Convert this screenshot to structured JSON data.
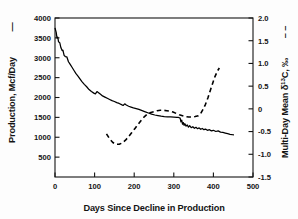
{
  "chart_data": {
    "type": "line",
    "title": "",
    "xlabel": "Days Since Decline in Production",
    "ylabel": "Production, Mcf/Day",
    "y2label": "Multi-Day Mean δ¹³C, ‰",
    "xlim": [
      0,
      500
    ],
    "ylim": [
      0,
      4000
    ],
    "y2lim": [
      -1.5,
      2.0
    ],
    "xticks": [
      0,
      100,
      200,
      300,
      400,
      500
    ],
    "xtick_labels": [
      "0",
      "100",
      "200",
      "300",
      "400",
      "500"
    ],
    "yticks": [
      500,
      1000,
      1500,
      2000,
      2500,
      3000,
      3500,
      4000
    ],
    "ytick_labels": [
      "500",
      "1000",
      "1500",
      "2000",
      "2500",
      "3000",
      "3500",
      "4000"
    ],
    "y2ticks": [
      -1.5,
      -1.0,
      -0.5,
      0,
      0.5,
      1.0,
      1.5,
      2.0
    ],
    "y2tick_labels": [
      "-1.5",
      "-1.0",
      "-0.5",
      "0",
      "0.5",
      "1.0",
      "1.5",
      "2.0"
    ],
    "grid": false,
    "legend_position": "axis-titles",
    "series": [
      {
        "name": "Production, Mcf/Day",
        "axis": "left",
        "style": "solid",
        "color": "#000000",
        "legend_marker": "—",
        "points": [
          [
            0,
            3750
          ],
          [
            3,
            3640
          ],
          [
            5,
            3500
          ],
          [
            7,
            3520
          ],
          [
            9,
            3400
          ],
          [
            12,
            3380
          ],
          [
            15,
            3250
          ],
          [
            18,
            3180
          ],
          [
            20,
            3190
          ],
          [
            23,
            3060
          ],
          [
            26,
            3030
          ],
          [
            30,
            3020
          ],
          [
            34,
            2900
          ],
          [
            38,
            2840
          ],
          [
            43,
            2760
          ],
          [
            48,
            2680
          ],
          [
            53,
            2600
          ],
          [
            58,
            2540
          ],
          [
            63,
            2470
          ],
          [
            68,
            2400
          ],
          [
            74,
            2330
          ],
          [
            80,
            2270
          ],
          [
            86,
            2200
          ],
          [
            92,
            2150
          ],
          [
            98,
            2110
          ],
          [
            102,
            2090
          ],
          [
            106,
            2150
          ],
          [
            110,
            2120
          ],
          [
            115,
            2080
          ],
          [
            120,
            2040
          ],
          [
            126,
            2010
          ],
          [
            132,
            1980
          ],
          [
            138,
            1950
          ],
          [
            144,
            1920
          ],
          [
            150,
            1900
          ],
          [
            156,
            1870
          ],
          [
            162,
            1850
          ],
          [
            168,
            1820
          ],
          [
            172,
            1800
          ],
          [
            176,
            1840
          ],
          [
            180,
            1810
          ],
          [
            186,
            1780
          ],
          [
            192,
            1760
          ],
          [
            198,
            1740
          ],
          [
            205,
            1720
          ],
          [
            212,
            1700
          ],
          [
            220,
            1670
          ],
          [
            228,
            1640
          ],
          [
            236,
            1610
          ],
          [
            244,
            1580
          ],
          [
            252,
            1560
          ],
          [
            260,
            1545
          ],
          [
            268,
            1530
          ],
          [
            276,
            1520
          ],
          [
            284,
            1515
          ],
          [
            292,
            1510
          ],
          [
            300,
            1505
          ],
          [
            308,
            1500
          ],
          [
            312,
            1498
          ],
          [
            316,
            1480
          ],
          [
            318,
            1390
          ],
          [
            320,
            1430
          ],
          [
            322,
            1330
          ],
          [
            324,
            1370
          ],
          [
            326,
            1300
          ],
          [
            328,
            1340
          ],
          [
            331,
            1280
          ],
          [
            334,
            1310
          ],
          [
            337,
            1255
          ],
          [
            340,
            1290
          ],
          [
            344,
            1240
          ],
          [
            348,
            1265
          ],
          [
            352,
            1225
          ],
          [
            356,
            1250
          ],
          [
            360,
            1215
          ],
          [
            364,
            1235
          ],
          [
            368,
            1200
          ],
          [
            372,
            1220
          ],
          [
            376,
            1190
          ],
          [
            380,
            1205
          ],
          [
            385,
            1175
          ],
          [
            390,
            1190
          ],
          [
            395,
            1160
          ],
          [
            400,
            1175
          ],
          [
            406,
            1145
          ],
          [
            412,
            1160
          ],
          [
            418,
            1130
          ],
          [
            424,
            1120
          ],
          [
            430,
            1105
          ],
          [
            436,
            1090
          ],
          [
            442,
            1075
          ],
          [
            448,
            1065
          ],
          [
            452,
            1060
          ]
        ]
      },
      {
        "name": "Multi-Day Mean δ¹³C, ‰",
        "axis": "right",
        "style": "dashed",
        "color": "#000000",
        "legend_marker": "––",
        "points": [
          [
            130,
            -0.55
          ],
          [
            138,
            -0.66
          ],
          [
            146,
            -0.74
          ],
          [
            154,
            -0.78
          ],
          [
            162,
            -0.78
          ],
          [
            170,
            -0.75
          ],
          [
            178,
            -0.69
          ],
          [
            186,
            -0.61
          ],
          [
            194,
            -0.52
          ],
          [
            202,
            -0.43
          ],
          [
            210,
            -0.34
          ],
          [
            218,
            -0.25
          ],
          [
            226,
            -0.17
          ],
          [
            234,
            -0.11
          ],
          [
            242,
            -0.08
          ],
          [
            250,
            -0.06
          ],
          [
            258,
            -0.04
          ],
          [
            266,
            -0.03
          ],
          [
            274,
            -0.03
          ],
          [
            282,
            -0.04
          ],
          [
            290,
            -0.05
          ],
          [
            298,
            -0.07
          ],
          [
            306,
            -0.1
          ],
          [
            314,
            -0.13
          ],
          [
            322,
            -0.15
          ],
          [
            330,
            -0.17
          ],
          [
            338,
            -0.18
          ],
          [
            346,
            -0.18
          ],
          [
            354,
            -0.17
          ],
          [
            362,
            -0.15
          ],
          [
            368,
            -0.1
          ],
          [
            374,
            -0.01
          ],
          [
            380,
            0.1
          ],
          [
            386,
            0.24
          ],
          [
            392,
            0.4
          ],
          [
            398,
            0.56
          ],
          [
            404,
            0.71
          ],
          [
            410,
            0.83
          ],
          [
            415,
            0.9
          ]
        ]
      }
    ]
  },
  "axes": {
    "left_title": "Production, Mcf/Day",
    "left_legend_marker": "—",
    "right_title": "Multi-Day Mean δ",
    "right_title_sup": "13",
    "right_title_tail": "C, ‰",
    "right_legend_marker": "– –",
    "x_title": "Days Since Decline in Production"
  },
  "colors": {
    "axis": "#141414",
    "series_solid": "#000000",
    "series_dashed": "#000000",
    "background": "#fdfdfd",
    "plot_background": "#ffffff"
  }
}
